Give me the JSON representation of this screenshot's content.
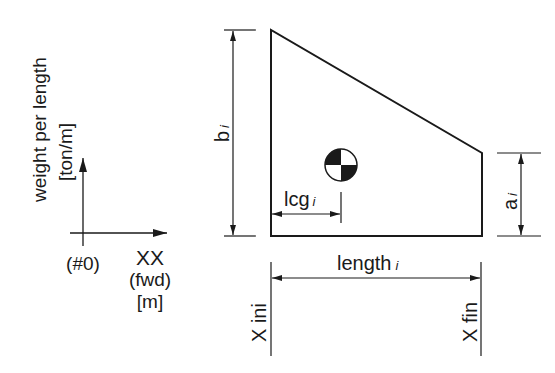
{
  "axes": {
    "y_label": "weight per length",
    "y_unit": "[ton/m]",
    "origin_label": "(#0)",
    "x_label": "XX",
    "x_direction": "(fwd)",
    "x_unit": "[m]"
  },
  "shape": {
    "height_start_label": "b",
    "height_start_subscript": "i",
    "height_end_label": "a",
    "height_end_subscript": "i",
    "lcg_label": "lcg",
    "lcg_subscript": "i",
    "length_label": "length",
    "length_subscript": "i",
    "x_start_label": "X ini",
    "x_end_label": "X fin",
    "cg_symbol": "center-of-gravity-icon"
  },
  "colors": {
    "line": "#1a1a1a",
    "background": "#ffffff"
  }
}
